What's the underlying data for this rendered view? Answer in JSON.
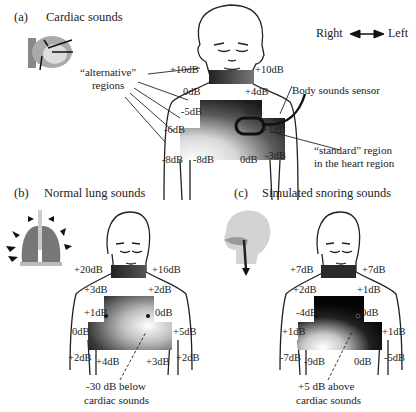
{
  "panels": {
    "a": {
      "letter": "(a)",
      "title": "Cardiac sounds",
      "orientation": {
        "right": "Right",
        "left": "Left"
      },
      "labels": {
        "neck_right": "+10dB",
        "neck_left": "+10dB",
        "upper_right": "0dB",
        "upper_left": "+4dB",
        "mid_right": "-5dB",
        "mid_left": "0dB",
        "side_right": "-6dB",
        "side_left": "+1dB",
        "low_right_outer": "-8dB",
        "low_right_inner": "-8dB",
        "low_left_inner": "0dB",
        "low_left_outer": "-3dB"
      },
      "annotations": {
        "alternative": "“alternative”\nregions",
        "sensor": "Body sounds sensor",
        "standard_line1": "“standard” region",
        "standard_line2": "in the heart region"
      }
    },
    "b": {
      "letter": "(b)",
      "title": "Normal lung sounds",
      "labels": {
        "neck_right": "+20dB",
        "neck_left": "+16dB",
        "upper_right": "+3dB",
        "upper_left": "+2dB",
        "mid_right": "+1dB",
        "mid_left": "0dB",
        "side_right": "0dB",
        "side_left": "+5dB",
        "low_right_outer": "+2dB",
        "low_right_inner": "+4dB",
        "low_left_inner": "+3dB",
        "low_left_outer": "+2dB"
      },
      "annotations": {
        "note_line1": "-30 dB below",
        "note_line2": "cardiac sounds"
      }
    },
    "c": {
      "letter": "(c)",
      "title": "Simulated snoring sounds",
      "labels": {
        "neck_right": "+7dB",
        "neck_left": "+7dB",
        "upper_right": "+2dB",
        "upper_left": "+1dB",
        "mid_right": "-4dB",
        "mid_left": "0dB",
        "side_right": "+1dB",
        "side_left": "+1dB",
        "low_right_outer": "-7dB",
        "low_right_inner": "-9dB",
        "low_left_inner": "0dB",
        "low_left_outer": "-5dB"
      },
      "annotations": {
        "note_line1": "+5 dB above",
        "note_line2": "cardiac sounds"
      }
    }
  },
  "icons": {
    "a": "heart-icon",
    "b": "lungs-icon",
    "c": "head-airway-icon"
  }
}
